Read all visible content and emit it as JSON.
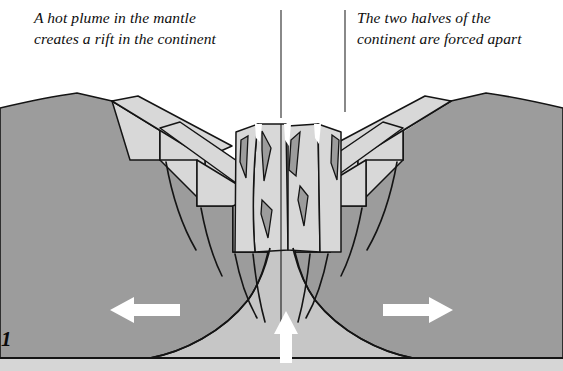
{
  "figure": {
    "number_label": "1",
    "type": "geological-cross-section",
    "title_visible": false
  },
  "captions": {
    "left": {
      "line1": "A hot plume in the mantle",
      "line2": "creates a rift in the continent"
    },
    "right": {
      "line1": "The two halves of the",
      "line2": "continent are forced apart"
    }
  },
  "dividers": {
    "left_rule_x": 281,
    "right_rule_x": 345,
    "rule_top": 10,
    "left_rule_bottom": 118,
    "right_rule_bottom": 112
  },
  "arrows": {
    "left": {
      "label": "extension-left",
      "direction": "left",
      "color": "#ffffff",
      "x": 110,
      "y": 299,
      "width": 70,
      "height": 22
    },
    "right": {
      "label": "extension-right",
      "direction": "right",
      "color": "#ffffff",
      "x": 383,
      "y": 299,
      "width": 70,
      "height": 22
    },
    "center": {
      "label": "mantle-plume-upwelling",
      "direction": "up",
      "color": "#ffffff",
      "x": 275,
      "y": 311,
      "width": 22,
      "height": 52
    }
  },
  "colors": {
    "background": "#ffffff",
    "crust_dark": "#9c9c9c",
    "fault_block_light": "#d8d8d8",
    "plume_light": "#c6c6c6",
    "base_strip": "#d6d6d6",
    "outline": "#141414",
    "text": "#0d0d0d",
    "arrow": "#ffffff"
  },
  "regions": [
    {
      "name": "left-continental-flank",
      "fill": "crust_dark"
    },
    {
      "name": "right-continental-flank",
      "fill": "crust_dark"
    },
    {
      "name": "left-stepped-fault-blocks",
      "fill": "fault_block_light",
      "count": 4
    },
    {
      "name": "right-stepped-fault-blocks",
      "fill": "fault_block_light",
      "count": 4
    },
    {
      "name": "central-rift-valley-blocks",
      "fill": "fault_block_light"
    },
    {
      "name": "rising-mantle-plume",
      "fill": "plume_light"
    },
    {
      "name": "lower-mantle-basal-strip",
      "fill": "base_strip"
    }
  ]
}
